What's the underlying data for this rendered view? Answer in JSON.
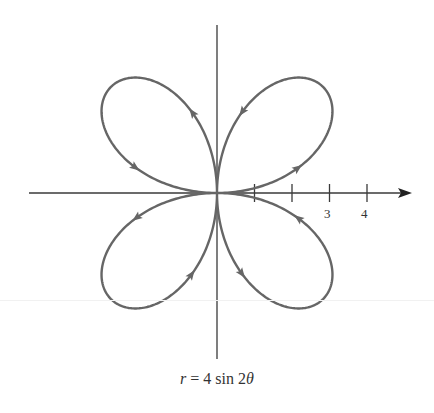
{
  "chart_data": {
    "type": "line",
    "subtype": "polar-rose",
    "title": "r = 4 sin 2θ",
    "equation": "r = 4 sin 2θ",
    "amplitude": 4,
    "petals": 4,
    "xlabel": "",
    "ylabel": "",
    "x_tick_positions": [
      1,
      2,
      3,
      4
    ],
    "x_tick_labels": [
      "",
      "",
      "3",
      "4"
    ],
    "xlim": [
      -5,
      5.4
    ],
    "ylim": [
      -4.5,
      4.5
    ],
    "grid": false,
    "legend": null,
    "direction_arrows": true,
    "sample_points": [
      {
        "theta_deg": 0,
        "r": 0
      },
      {
        "theta_deg": 15,
        "r": 2.0
      },
      {
        "theta_deg": 30,
        "r": 3.46
      },
      {
        "theta_deg": 45,
        "r": 4.0
      },
      {
        "theta_deg": 60,
        "r": 3.46
      },
      {
        "theta_deg": 75,
        "r": 2.0
      },
      {
        "theta_deg": 90,
        "r": 0
      },
      {
        "theta_deg": 105,
        "r": -2.0
      },
      {
        "theta_deg": 120,
        "r": -3.46
      },
      {
        "theta_deg": 135,
        "r": -4.0
      },
      {
        "theta_deg": 150,
        "r": -3.46
      },
      {
        "theta_deg": 165,
        "r": -2.0
      },
      {
        "theta_deg": 180,
        "r": 0
      },
      {
        "theta_deg": 225,
        "r": 4.0
      },
      {
        "theta_deg": 315,
        "r": -4.0
      },
      {
        "theta_deg": 360,
        "r": 0
      }
    ]
  },
  "colors": {
    "curve": "#666666",
    "axis": "#3a3a3a"
  },
  "labels": {
    "tick_3": "3",
    "tick_4": "4",
    "caption_lhs": "r",
    "caption_rhs": " = 4 sin 2",
    "caption_theta": "θ"
  }
}
